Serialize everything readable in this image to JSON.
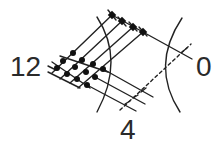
{
  "diagram": {
    "labels": {
      "left": "12",
      "right": "0",
      "bottom": "4"
    },
    "colors": {
      "stroke": "#222222",
      "node": "#111111",
      "background": "#ffffff"
    },
    "elements": {
      "arcs": 2,
      "lattice_nodes": 12,
      "upper_arm_nodes": 4,
      "parallel_lines_upper": 4,
      "parallel_lines_lower": 3,
      "dashed_line": 1
    }
  }
}
